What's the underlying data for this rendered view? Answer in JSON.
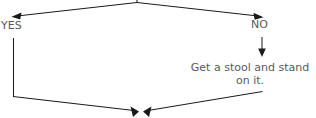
{
  "diagram": {
    "type": "flowchart-fragment",
    "background_color": "#ffffff",
    "line_color": "#1a1a1a",
    "text_color": "#5a5a5a",
    "branch_labels": {
      "yes": "YES",
      "no": "NO"
    },
    "nodes": [
      {
        "id": "stool-step",
        "lines": [
          "Get a stool and stand",
          "on it."
        ]
      }
    ],
    "connectors": [
      {
        "id": "branch-to-yes",
        "from": "decision-apex",
        "to": "yes-path",
        "arrowhead": "left-down"
      },
      {
        "id": "branch-to-no",
        "from": "decision-apex",
        "to": "no-path",
        "arrowhead": "right-down"
      },
      {
        "id": "no-to-stool",
        "from": "no-path",
        "to": "stool-step",
        "arrowhead": "down"
      },
      {
        "id": "yes-to-merge",
        "from": "yes-path",
        "to": "merge-point",
        "arrowhead": "down-right"
      },
      {
        "id": "stool-to-merge",
        "from": "stool-step",
        "to": "merge-point",
        "arrowhead": "down-left"
      }
    ]
  }
}
